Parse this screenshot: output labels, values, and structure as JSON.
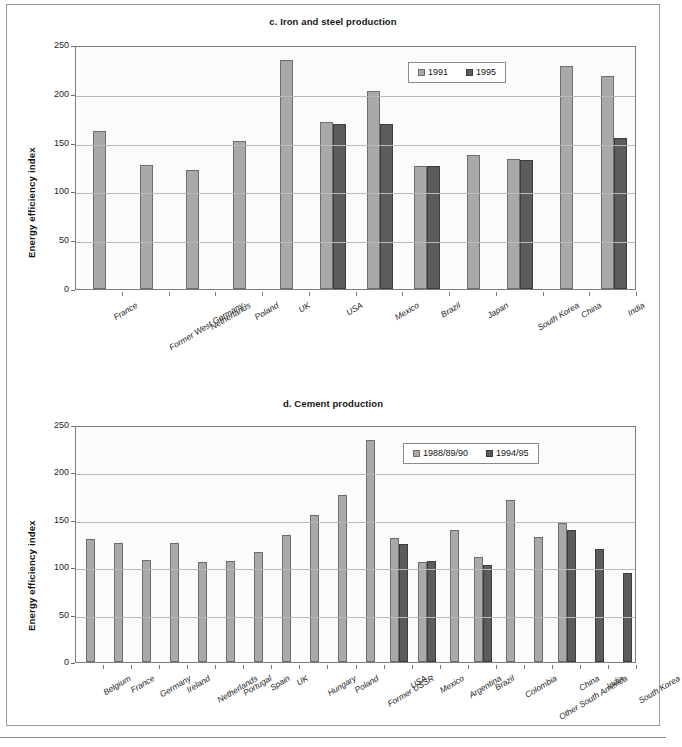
{
  "figure": {
    "axis_title": "Energy efficiency index"
  },
  "chart_data": [
    {
      "type": "bar",
      "title": "c. Iron and steel production",
      "xlabel": "",
      "ylabel": "Energy efficiency index",
      "ylim": [
        0,
        250
      ],
      "yticks": [
        0,
        50,
        100,
        150,
        200,
        250
      ],
      "grid": true,
      "legend_position": "top-right",
      "colors": {
        "series0": "#a9a9a9",
        "series1": "#5c5c5c"
      },
      "categories": [
        "France",
        "Former West Germany",
        "Netherlands",
        "Poland",
        "UK",
        "USA",
        "Mexico",
        "Brazil",
        "Japan",
        "South Korea",
        "China",
        "India"
      ],
      "series": [
        {
          "name": "1991",
          "values": [
            162,
            127,
            122,
            152,
            235,
            171,
            203,
            126,
            137,
            133,
            229,
            218
          ]
        },
        {
          "name": "1995",
          "values": [
            null,
            null,
            null,
            null,
            null,
            169,
            169,
            126,
            null,
            132,
            null,
            155
          ]
        }
      ]
    },
    {
      "type": "bar",
      "title": "d. Cement production",
      "xlabel": "",
      "ylabel": "Energy efficiency index",
      "ylim": [
        0,
        250
      ],
      "yticks": [
        0,
        50,
        100,
        150,
        200,
        250
      ],
      "grid": true,
      "legend_position": "top-right",
      "colors": {
        "series0": "#a9a9a9",
        "series1": "#5c5c5c"
      },
      "categories": [
        "Belgium",
        "France",
        "Germany",
        "Ireland",
        "Netherlands",
        "Portugal",
        "Spain",
        "UK",
        "Hungary",
        "Poland",
        "Former USSR",
        "USA",
        "Mexico",
        "Argentina",
        "Brazil",
        "Colombia",
        "Other South America",
        "China",
        "India",
        "South Korea"
      ],
      "series": [
        {
          "name": "1988/89/90",
          "values": [
            130,
            126,
            108,
            126,
            105,
            107,
            116,
            134,
            155,
            176,
            234,
            131,
            105,
            139,
            111,
            171,
            132,
            147,
            null,
            null
          ]
        },
        {
          "name": "1994/95",
          "values": [
            null,
            null,
            null,
            null,
            null,
            null,
            null,
            null,
            null,
            null,
            null,
            124,
            107,
            null,
            102,
            null,
            null,
            139,
            119,
            94
          ]
        }
      ]
    }
  ]
}
